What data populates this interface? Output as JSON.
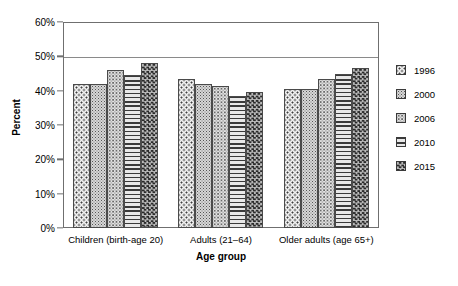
{
  "chart_data": {
    "type": "bar",
    "title": "",
    "xlabel": "Age group",
    "ylabel": "Percent",
    "categories": [
      "Children (birth-age 20)",
      "Adults (21–64)",
      "Older adults (age 65+)"
    ],
    "series": [
      {
        "name": "1996",
        "values": [
          42.0,
          43.5,
          40.5
        ],
        "pattern": "dotted-light",
        "color": "#efefef"
      },
      {
        "name": "2000",
        "values": [
          42.0,
          42.0,
          40.5
        ],
        "pattern": "speckle-mid",
        "color": "#d6d6d6"
      },
      {
        "name": "2006",
        "values": [
          46.0,
          41.5,
          43.5
        ],
        "pattern": "speckle-light",
        "color": "#e3e3e3"
      },
      {
        "name": "2010",
        "values": [
          44.5,
          38.5,
          45.0
        ],
        "pattern": "horizontal-lines",
        "color": "#dcdcdc"
      },
      {
        "name": "2015",
        "values": [
          48.0,
          39.5,
          46.5
        ],
        "pattern": "checkerboard-dark",
        "color": "#4f4f4f"
      }
    ],
    "ylim": [
      0,
      60
    ],
    "yticks": [
      0,
      10,
      20,
      30,
      40,
      50,
      60
    ],
    "ytick_labels": [
      "0%",
      "10%",
      "20%",
      "30%",
      "40%",
      "50%",
      "60%"
    ],
    "grid": "horizontal-partial",
    "legend_position": "right",
    "legend_entries": [
      "1996",
      "2000",
      "2006",
      "2010",
      "2015"
    ]
  }
}
